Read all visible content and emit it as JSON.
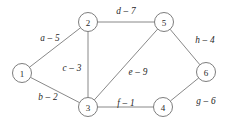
{
  "figure": {
    "kind": "undirected-weighted-graph",
    "background_color": "#ffffff",
    "stroke_color": "#7a7a7a",
    "text_color": "#1f1f1f"
  },
  "nodes": [
    {
      "id": "1",
      "label": "1",
      "x": 22,
      "y": 73,
      "r": 9.5
    },
    {
      "id": "2",
      "label": "2",
      "x": 88,
      "y": 22,
      "r": 9.5
    },
    {
      "id": "3",
      "label": "3",
      "x": 88,
      "y": 107,
      "r": 9.5
    },
    {
      "id": "4",
      "label": "4",
      "x": 163,
      "y": 107,
      "r": 9.5
    },
    {
      "id": "5",
      "label": "5",
      "x": 164,
      "y": 22,
      "r": 9.5
    },
    {
      "id": "6",
      "label": "6",
      "x": 206,
      "y": 72,
      "r": 9.5
    }
  ],
  "edges": [
    {
      "id": "a",
      "from": "1",
      "to": "2",
      "name": "a",
      "weight": "5",
      "label": "a – 5",
      "label_x": 50,
      "label_y": 38
    },
    {
      "id": "b",
      "from": "1",
      "to": "3",
      "name": "b",
      "weight": "2",
      "label": "b – 2",
      "label_x": 48,
      "label_y": 97
    },
    {
      "id": "c",
      "from": "2",
      "to": "3",
      "name": "c",
      "weight": "3",
      "label": "c – 3",
      "label_x": 72,
      "label_y": 68
    },
    {
      "id": "d",
      "from": "2",
      "to": "5",
      "name": "d",
      "weight": "7",
      "label": "d – 7",
      "label_x": 126,
      "label_y": 11
    },
    {
      "id": "e",
      "from": "3",
      "to": "5",
      "name": "e",
      "weight": "9",
      "label": "e – 9",
      "label_x": 138,
      "label_y": 72
    },
    {
      "id": "f",
      "from": "3",
      "to": "4",
      "name": "f",
      "weight": "1",
      "label": "f – 1",
      "label_x": 126,
      "label_y": 103
    },
    {
      "id": "g",
      "from": "4",
      "to": "6",
      "name": "g",
      "weight": "6",
      "label": "g – 6",
      "label_x": 206,
      "label_y": 101
    },
    {
      "id": "h",
      "from": "5",
      "to": "6",
      "name": "h",
      "weight": "4",
      "label": "h – 4",
      "label_x": 205,
      "label_y": 40
    }
  ]
}
